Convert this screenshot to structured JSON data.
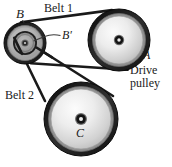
{
  "figure": {
    "title_alt": "Two-belt pulley system diagram",
    "background_color": "#ffffff",
    "width": 172,
    "height": 167,
    "labels": {
      "belt1": "Belt 1",
      "belt2": "Belt 2",
      "pulley_b": "B",
      "pulley_b_prime": "B′",
      "pulley_a": "A",
      "drive_pulley_line1": "Drive",
      "drive_pulley_line2": "pulley",
      "pulley_c": "C"
    },
    "colors": {
      "outline": "#1a1a1a",
      "belt": "#1a1a1a",
      "rim_dark": "#242424",
      "rim_mid": "#3a3a3a",
      "face_light": "#f2f2f2",
      "face_mid": "#c9c9c9",
      "face_gray": "#a8a8a8",
      "hub_dark": "#111111",
      "text": "#1a1a1a"
    },
    "pulleys": [
      {
        "name": "A",
        "role": "drive pulley",
        "center_x": 119,
        "center_y": 40,
        "outer_radius": 31,
        "rim_radius": 28,
        "face_radius": 24,
        "hub_radius": 4
      },
      {
        "name": "B",
        "role": "compound pulley (outer)",
        "center_x": 25,
        "center_y": 43,
        "outer_radius": 21,
        "rim_radius": 18,
        "face_radius": 16,
        "hub_radius": 3
      },
      {
        "name": "B′",
        "role": "compound pulley (inner)",
        "center_x": 25,
        "center_y": 43,
        "outer_radius": 12,
        "rim_radius": 10,
        "face_radius": 8,
        "hub_radius": 3
      },
      {
        "name": "C",
        "role": "driven pulley",
        "center_x": 81,
        "center_y": 119,
        "outer_radius": 37,
        "rim_radius": 34,
        "face_radius": 30,
        "hub_radius": 4
      }
    ],
    "belts": [
      {
        "name": "Belt 1",
        "connects": [
          "A",
          "B"
        ],
        "description": "runs over large drive pulley A and outer pulley B"
      },
      {
        "name": "Belt 2",
        "connects": [
          "B′",
          "C"
        ],
        "description": "runs over inner pulley B-prime and pulley C"
      }
    ]
  }
}
